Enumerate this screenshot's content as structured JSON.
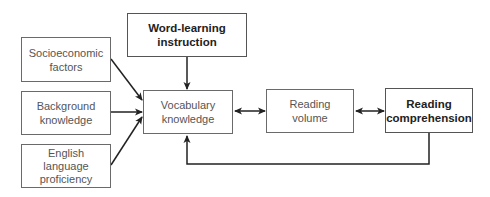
{
  "nodes": {
    "word_learning": {
      "label": "Word-learning instruction",
      "line1": "Word-learning",
      "line2": "instruction"
    },
    "socioeconomic": {
      "line1": "Socioeconomic",
      "line2": "factors"
    },
    "background": {
      "line1": "Background",
      "line2": "knowledge"
    },
    "english": {
      "line1": "English",
      "line2": "language",
      "line3": "proficiency"
    },
    "vocabulary": {
      "line1": "Vocabulary",
      "line2": "knowledge"
    },
    "reading_volume": {
      "line1": "Reading",
      "line2": "volume"
    },
    "reading_comprehension": {
      "line1": "Reading",
      "line2": "comprehension"
    }
  },
  "edges": [
    {
      "from": "socioeconomic",
      "to": "vocabulary",
      "type": "arrow"
    },
    {
      "from": "background",
      "to": "vocabulary",
      "type": "arrow"
    },
    {
      "from": "english",
      "to": "vocabulary",
      "type": "arrow"
    },
    {
      "from": "word_learning",
      "to": "vocabulary",
      "type": "arrow"
    },
    {
      "from": "vocabulary",
      "to": "reading_volume",
      "type": "bidirectional"
    },
    {
      "from": "reading_volume",
      "to": "reading_comprehension",
      "type": "bidirectional"
    },
    {
      "from": "reading_comprehension",
      "to": "vocabulary",
      "type": "feedback-arrow"
    }
  ]
}
